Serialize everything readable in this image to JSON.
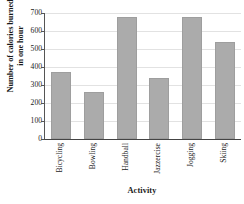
{
  "chart_data": {
    "type": "bar",
    "title": "",
    "xlabel": "Activity",
    "ylabel_line1": "Number of calories burned",
    "ylabel_line2": "in one hour",
    "categories": [
      "Bicycling",
      "Bowling",
      "Handball",
      "Jazzercise",
      "Jogging",
      "Skiing"
    ],
    "values": [
      375,
      260,
      680,
      340,
      680,
      540
    ],
    "ylim": [
      0,
      700
    ],
    "yticks": [
      0,
      100,
      200,
      300,
      400,
      500,
      600,
      700
    ],
    "ytick_labels": [
      "0",
      "100",
      "200",
      "300",
      "400",
      "500",
      "600",
      "700"
    ],
    "grid": true,
    "grid_axis": "y",
    "legend": false,
    "bar_color": "#ababab",
    "bar_edge_color": "#9e9e9e",
    "grid_color": "#e2e2e2",
    "axis_color": "#555555",
    "background_color": "#ffffff"
  }
}
